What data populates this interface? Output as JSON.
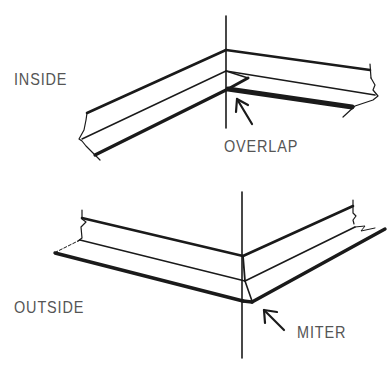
{
  "figure": {
    "inside_diagram": {
      "label": "INSIDE",
      "callout": "OVERLAP"
    },
    "outside_diagram": {
      "label": "OUTSIDE",
      "callout": "MITER"
    },
    "colors": {
      "line": "#1a1a1a",
      "text": "#555555",
      "background": "#ffffff"
    }
  }
}
